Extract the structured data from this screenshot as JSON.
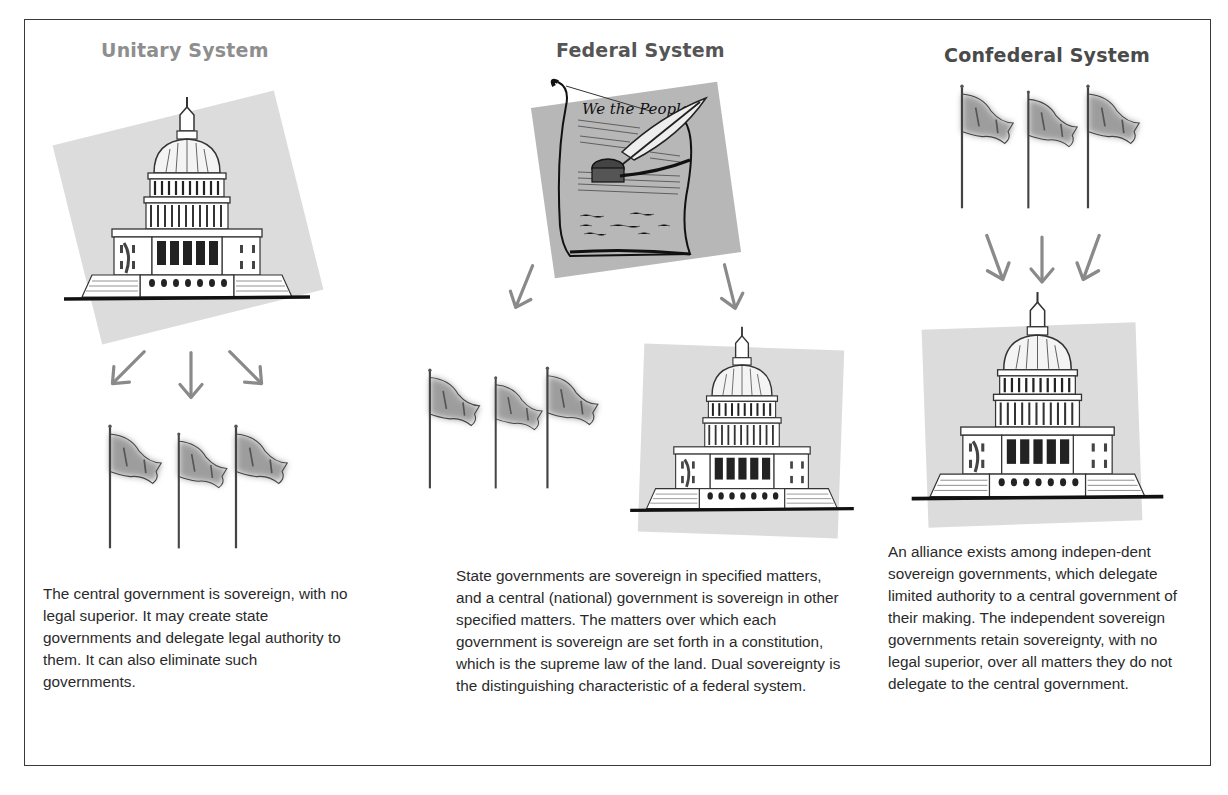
{
  "columns": [
    {
      "id": "unitary",
      "title": "Unitary System",
      "title_color": "#8e8e8e",
      "top_image": "capitol-building",
      "bottom_image": "three-flags",
      "arrows": [
        "down-left",
        "down",
        "down-right"
      ],
      "description": "The central government is sovereign, with no legal superior. It may create state governments and delegate legal authority to them. It can also eliminate such governments."
    },
    {
      "id": "federal",
      "title": "Federal System",
      "title_color": "#555555",
      "top_image": "constitution-document",
      "document_heading": "We the People",
      "bottom_images": [
        "three-flags",
        "capitol-building"
      ],
      "arrows": [
        "down-left",
        "down-right"
      ],
      "description": "State governments are sovereign in specified matters, and a central (national) government is sovereign in other specified matters. The matters over which each government is sovereign are set forth in a constitution, which is the supreme law of the land. Dual sovereignty is the distinguishing characteristic of a federal system."
    },
    {
      "id": "confederal",
      "title": "Confederal System",
      "title_color": "#4a4a4a",
      "top_image": "three-flags",
      "bottom_image": "capitol-building",
      "arrows": [
        "down-right",
        "down",
        "down-left"
      ],
      "description": "An alliance exists among indepen-dent sovereign governments, which delegate limited authority to a central government of their making. The independent sovereign governments retain sovereignty, with no legal superior, over all matters they do not delegate to the central government."
    }
  ],
  "colors": {
    "frame": "#3a3a3a",
    "arrow": "#8a8a8a",
    "panel": "#d9d9d9",
    "panel_dark": "#b3b3b3",
    "flag": "#9a9a9a",
    "text": "#2a2a2a"
  }
}
